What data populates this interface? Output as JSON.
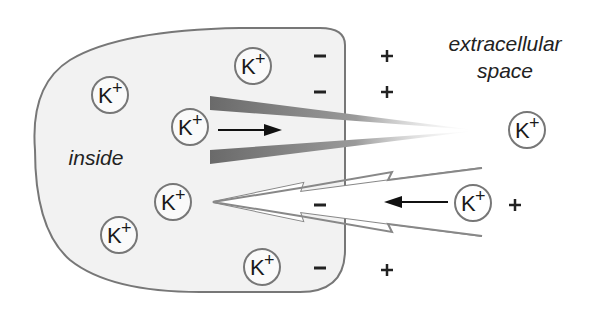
{
  "labels": {
    "inside": "inside",
    "extracellular_line1": "extracellular",
    "extracellular_line2": "space"
  },
  "ion": {
    "symbol": "K",
    "charge": "+"
  },
  "ions": [
    {
      "x": 110,
      "y": 95,
      "region": "inside"
    },
    {
      "x": 253,
      "y": 66,
      "region": "inside"
    },
    {
      "x": 190,
      "y": 127,
      "region": "inside"
    },
    {
      "x": 173,
      "y": 202,
      "region": "inside"
    },
    {
      "x": 119,
      "y": 235,
      "region": "inside"
    },
    {
      "x": 262,
      "y": 267,
      "region": "inside"
    },
    {
      "x": 527,
      "y": 130,
      "region": "extracellular"
    },
    {
      "x": 473,
      "y": 203,
      "region": "extracellular"
    }
  ],
  "charges": {
    "minus_symbol": "−",
    "plus_symbol": "+",
    "minus": [
      {
        "x": 320,
        "y": 56
      },
      {
        "x": 320,
        "y": 92
      },
      {
        "x": 320,
        "y": 205
      },
      {
        "x": 320,
        "y": 268
      }
    ],
    "plus": [
      {
        "x": 387,
        "y": 56
      },
      {
        "x": 387,
        "y": 92
      },
      {
        "x": 515,
        "y": 205
      },
      {
        "x": 387,
        "y": 270
      }
    ]
  },
  "arrows": {
    "outward": {
      "direction": "right",
      "description": "K+ efflux through concentration gradient"
    },
    "inward": {
      "direction": "left",
      "description": "K+ pulled in by electrical gradient"
    }
  },
  "colors": {
    "cell_fill": "#f2f2f2",
    "membrane": "#777777",
    "wedge": "#6e6e6e",
    "lightning": "#888888",
    "ion_circle": "#777777",
    "text": "#222222"
  }
}
